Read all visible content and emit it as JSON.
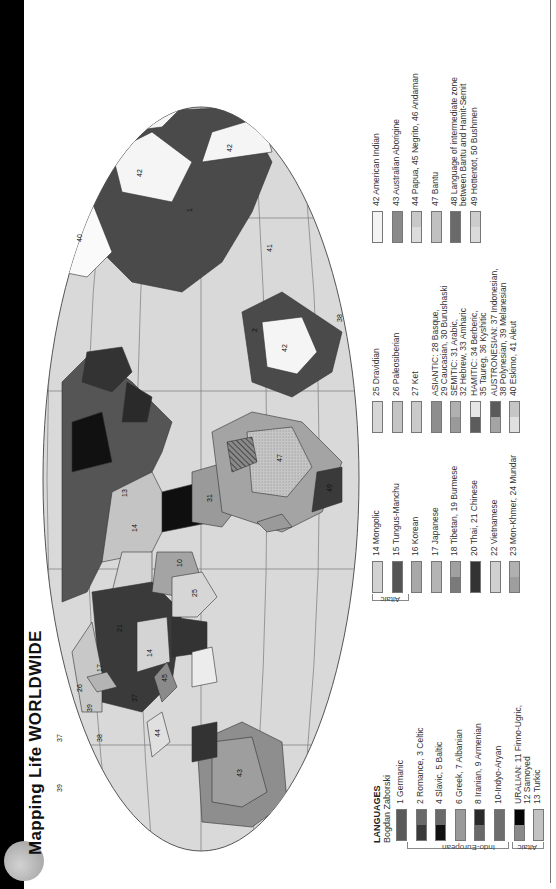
{
  "header": {
    "title": "Mapping Life WORLDWIDE",
    "bar_color": "#000000",
    "logo_color": "#b5b5b5"
  },
  "legend": {
    "heading": "LANGUAGES",
    "author": "Bogdan Zaborski",
    "groups": {
      "indo_european": "Indo-European",
      "altaic_1": "Altaic",
      "altaic_2": "Altaic"
    },
    "items": [
      {
        "label": "1 Germanic",
        "top": "#5a5a5a",
        "bottom": "#5a5a5a"
      },
      {
        "label": "2 Romance, 3 Celtic",
        "top": "#3a3a3a",
        "bottom": "#6a6a6a"
      },
      {
        "label": "4 Slavic, 5 Baltic",
        "top": "#111111",
        "bottom": "#6a6a6a"
      },
      {
        "label": "6 Greek, 7 Albanian",
        "top": "#9a9a9a",
        "bottom": "#9a9a9a"
      },
      {
        "label": "8 Iranian, 9 Armenian",
        "top": "#6a6a6a",
        "bottom": "#2a2a2a"
      },
      {
        "label": "10-Indyo-Aryan",
        "top": "#6e6e6e",
        "bottom": "#6e6e6e"
      },
      {
        "label": "URALIAN: 11 Finno-Ugric,\n12 Samoyed",
        "top": "#8a8a8a",
        "bottom": "#050505"
      },
      {
        "label": "13 Turkic",
        "top": "#c2c2c2",
        "bottom": "#c2c2c2"
      },
      {
        "label": "14 Mongolic",
        "top": "#d2d2d2",
        "bottom": "#d2d2d2"
      },
      {
        "label": "15 Tungus-Manchu",
        "top": "#555555",
        "bottom": "#555555"
      },
      {
        "label": "16 Korean",
        "top": "#a8a8a8",
        "bottom": "#a8a8a8"
      },
      {
        "label": "17 Japanese",
        "top": "#b4b4b4",
        "bottom": "#b4b4b4"
      },
      {
        "label": "18 Tibetan, 19 Burmese",
        "top": "#7a7a7a",
        "bottom": "#a0a0a0"
      },
      {
        "label": "20 Thai, 21 Chinese",
        "top": "#333333",
        "bottom": "#333333"
      },
      {
        "label": "22 Vietnamese",
        "top": "#d0d0d0",
        "bottom": "#d0d0d0"
      },
      {
        "label": "23 Mon-Khmer, 24 Mundar",
        "top": "#9e9e9e",
        "bottom": "#b0b0b0"
      },
      {
        "label": "25 Dravidian",
        "top": "#d6d6d6",
        "bottom": "#d6d6d6"
      },
      {
        "label": "26 Paleosiberian",
        "top": "#c4c4c4",
        "bottom": "#c4c4c4"
      },
      {
        "label": "27 Ket",
        "top": "#cacaca",
        "bottom": "#cacaca"
      },
      {
        "label": "ASIANTIC: 28 Basque,\n29 Caucasian, 30 Burushaski",
        "top": "#8e8e8e",
        "bottom": "#8e8e8e"
      },
      {
        "label": "SEMITIC: 31 Arabic,\n32 Hebrew, 33 Amharic",
        "top": "#9a9a9a",
        "bottom": "#b0b0b0"
      },
      {
        "label": "HAMITIC: 34 Berberic,\n35 Taureg, 36 Kyshitic",
        "top": "#5c5c5c",
        "bottom": "#e6e6e6"
      },
      {
        "label": "AUSTRONESIAN: 37 Indonesian,\n38 Polynesian, 39 Melanesian",
        "top": "#a4a4a4",
        "bottom": "#5a5a5a"
      },
      {
        "label": "40 Eskimo, 41 Aleut",
        "top": "#e0e0e0",
        "bottom": "#c6c6c6"
      },
      {
        "label": "42 American Indian",
        "top": "#f4f4f4",
        "bottom": "#f4f4f4"
      },
      {
        "label": "43 Australian Aborigine",
        "top": "#8a8a8a",
        "bottom": "#8a8a8a"
      },
      {
        "label": "44 Papua, 45 Negrito, 46 Andaman",
        "top": "#dcdcdc",
        "bottom": "#c8c8c8"
      },
      {
        "label": "47 Bantu",
        "top": "#c0c0c0",
        "bottom": "#c0c0c0"
      },
      {
        "label": "48 Language of intermediate zone\nbetween Bantu and Hamit-Semit",
        "top": "#6a6a6a",
        "bottom": "#6a6a6a"
      },
      {
        "label": "49 Hottentot, 50 Bushmen",
        "top": "#dadada",
        "bottom": "#cccccc"
      }
    ]
  },
  "map": {
    "ocean_color": "#d9d9d9",
    "graticule_color": "#7a7a7a",
    "labels": [
      "1",
      "2",
      "4",
      "8",
      "10",
      "11",
      "12",
      "13",
      "14",
      "15",
      "16",
      "17",
      "18",
      "20",
      "21",
      "22",
      "24",
      "25",
      "26",
      "28",
      "31",
      "32",
      "33",
      "34",
      "36",
      "37",
      "38",
      "39",
      "40",
      "41",
      "42",
      "43",
      "44",
      "45",
      "47",
      "48"
    ]
  }
}
